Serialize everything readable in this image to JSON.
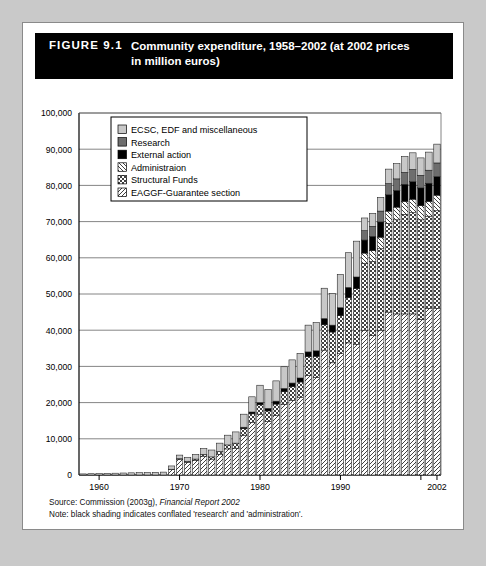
{
  "figure": {
    "number": "FIGURE 9.1",
    "title_line1": "Community expenditure, 1958–2002 (at 2002 prices",
    "title_line2": "in million euros)"
  },
  "footer": {
    "source_prefix": "Source: Commission (2003g), ",
    "source_italic": "Financial Report 2002",
    "note": "Note: black shading indicates conflated 'research' and 'administration'."
  },
  "colors": {
    "ecsc": "#c8c8c8",
    "research": "#6e6e6e",
    "external": "#000000",
    "administration": "#ffffff",
    "structural": "#ffffff",
    "eaggf": "#ffffff",
    "axis": "#000000",
    "grid": "#666666",
    "title_bg": "#000000",
    "title_fg": "#ffffff",
    "frame": "#8a8a8a"
  },
  "chart_data": {
    "type": "bar",
    "stacked": true,
    "xlabel": "",
    "ylabel": "",
    "ylim": [
      0,
      100000
    ],
    "ytick_step": 10000,
    "ytick_labels": [
      "0",
      "10,000",
      "20,000",
      "30,000",
      "40,000",
      "50,000",
      "60,000",
      "70,000",
      "80,000",
      "90,000",
      "100,000"
    ],
    "grid": true,
    "xlim": [
      1958,
      2002
    ],
    "xtick_labels": [
      "1960",
      "1970",
      "1980",
      "1990",
      "2000",
      "2002"
    ],
    "xtick_years": [
      1960,
      1970,
      1980,
      1990,
      2000,
      2002
    ],
    "legend_position": "upper-left-inside",
    "categories": [
      1958,
      1959,
      1960,
      1961,
      1962,
      1963,
      1964,
      1965,
      1966,
      1967,
      1968,
      1969,
      1970,
      1971,
      1972,
      1973,
      1974,
      1975,
      1976,
      1977,
      1978,
      1979,
      1980,
      1981,
      1982,
      1983,
      1984,
      1985,
      1986,
      1987,
      1988,
      1989,
      1990,
      1991,
      1992,
      1993,
      1994,
      1995,
      1996,
      1997,
      1998,
      1999,
      2000,
      2001,
      2002
    ],
    "series": [
      {
        "name": "EAGGF-Guarantee section",
        "pattern": "back-diagonal",
        "values": [
          0,
          0,
          0,
          0,
          0,
          0,
          0,
          0,
          0,
          0,
          0,
          1500,
          4300,
          3500,
          4000,
          5200,
          4400,
          5600,
          7200,
          7400,
          11000,
          14500,
          16800,
          14800,
          16400,
          19500,
          20600,
          21500,
          27500,
          27000,
          34500,
          31000,
          33500,
          36500,
          36000,
          40000,
          38500,
          40000,
          45000,
          44500,
          44500,
          44500,
          43000,
          46000,
          46000
        ]
      },
      {
        "name": "Structural Funds",
        "pattern": "cross-hatch",
        "values": [
          0,
          0,
          0,
          0,
          0,
          0,
          0,
          0,
          0,
          0,
          0,
          100,
          200,
          300,
          400,
          500,
          600,
          900,
          1100,
          1400,
          1800,
          2400,
          2600,
          2900,
          3200,
          3500,
          3800,
          4200,
          5200,
          5800,
          7000,
          8500,
          10500,
          12500,
          15500,
          18500,
          20500,
          22500,
          24500,
          26000,
          27500,
          28000,
          27500,
          25500,
          27000
        ]
      },
      {
        "name": "Administraion",
        "pattern": "forward-diagonal",
        "values": [
          0,
          0,
          0,
          0,
          0,
          0,
          0,
          0,
          0,
          0,
          0,
          0,
          0,
          0,
          0,
          0,
          0,
          0,
          0,
          0,
          0,
          0,
          0,
          0,
          0,
          0,
          0,
          0,
          0,
          0,
          0,
          0,
          0,
          0,
          0,
          2800,
          3000,
          3200,
          3400,
          3500,
          3600,
          3700,
          3900,
          4100,
          4300
        ]
      },
      {
        "name": "External action",
        "pattern": "solid",
        "values": [
          0,
          0,
          0,
          0,
          0,
          0,
          0,
          0,
          0,
          0,
          0,
          0,
          0,
          0,
          0,
          0,
          0,
          0,
          0,
          0,
          400,
          500,
          600,
          700,
          800,
          900,
          1000,
          1100,
          1300,
          1500,
          1700,
          1900,
          2200,
          2800,
          3200,
          3600,
          3900,
          4200,
          4500,
          4600,
          4700,
          4800,
          4900,
          5000,
          5100
        ]
      },
      {
        "name": "Research",
        "pattern": "solid",
        "values": [
          0,
          0,
          0,
          0,
          0,
          0,
          0,
          0,
          0,
          0,
          0,
          0,
          0,
          0,
          0,
          0,
          0,
          0,
          0,
          0,
          0,
          0,
          0,
          0,
          0,
          0,
          0,
          0,
          0,
          0,
          0,
          0,
          0,
          0,
          0,
          2600,
          2800,
          3000,
          3100,
          3200,
          3300,
          3400,
          3500,
          3600,
          3800
        ]
      },
      {
        "name": "ECSC, EDF and miscellaneous",
        "pattern": "solid",
        "values": [
          300,
          350,
          400,
          450,
          500,
          550,
          600,
          650,
          700,
          750,
          800,
          900,
          1000,
          1100,
          1300,
          1600,
          1900,
          2300,
          2700,
          3100,
          3600,
          4200,
          4800,
          5200,
          5600,
          6000,
          6400,
          6800,
          7400,
          7800,
          8400,
          8800,
          9200,
          9600,
          9900,
          3500,
          3600,
          3800,
          4000,
          4200,
          4400,
          4600,
          4800,
          5000,
          5200
        ]
      }
    ],
    "legend_entries": [
      {
        "label": "ECSC, EDF and miscellaneous",
        "swatch": "light-gray-fill"
      },
      {
        "label": "Research",
        "swatch": "mid-gray-fill"
      },
      {
        "label": "External action",
        "swatch": "black-fill"
      },
      {
        "label": "Administraion",
        "swatch": "forward-diagonal-hatch"
      },
      {
        "label": "Structural Funds",
        "swatch": "cross-hatch"
      },
      {
        "label": "EAGGF-Guarantee section",
        "swatch": "back-diagonal-hatch"
      }
    ]
  }
}
